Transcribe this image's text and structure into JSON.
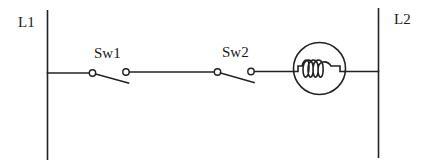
{
  "diagram": {
    "type": "ladder-circuit",
    "rails": [
      {
        "id": "L1",
        "label": "L1"
      },
      {
        "id": "L2",
        "label": "L2"
      }
    ],
    "components": [
      {
        "id": "sw1",
        "type": "switch-normally-open",
        "label": "Sw1"
      },
      {
        "id": "sw2",
        "type": "switch-normally-open",
        "label": "Sw2"
      },
      {
        "id": "lamp",
        "type": "lamp",
        "label": ""
      }
    ],
    "connections": [
      [
        "L1",
        "sw1"
      ],
      [
        "sw1",
        "sw2"
      ],
      [
        "sw2",
        "lamp"
      ],
      [
        "lamp",
        "L2"
      ]
    ],
    "colors": {
      "line": "#222222",
      "background": "#ffffff"
    }
  }
}
